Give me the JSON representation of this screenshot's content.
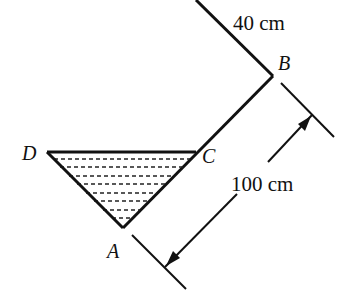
{
  "diagram": {
    "points": {
      "A": "A",
      "B": "B",
      "C": "C",
      "D": "D"
    },
    "dimensions": {
      "top_segment": "40 cm",
      "side_length": "100 cm"
    },
    "colors": {
      "stroke": "#111111",
      "background": "#ffffff"
    }
  }
}
